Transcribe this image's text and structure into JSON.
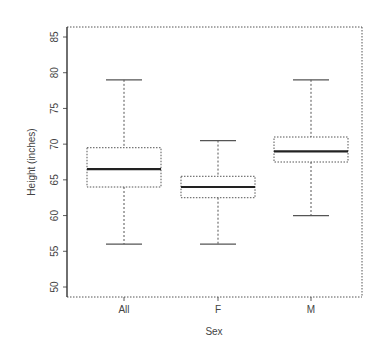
{
  "chart_data": {
    "type": "box",
    "title": "",
    "xlabel": "Sex",
    "ylabel": "Height (inches)",
    "categories": [
      "All",
      "F",
      "M"
    ],
    "ylim": [
      48.5,
      86.5
    ],
    "yticks": [
      50,
      55,
      60,
      65,
      70,
      75,
      80,
      85
    ],
    "grid": false,
    "legend": null,
    "boxes": [
      {
        "name": "All",
        "whisker_low": 56,
        "q1": 64,
        "median": 66.5,
        "q3": 69.5,
        "whisker_high": 79
      },
      {
        "name": "F",
        "whisker_low": 56,
        "q1": 62.5,
        "median": 64,
        "q3": 65.5,
        "whisker_high": 70.5
      },
      {
        "name": "M",
        "whisker_low": 60,
        "q1": 67.5,
        "median": 69,
        "q3": 71,
        "whisker_high": 79
      }
    ]
  },
  "labels": {
    "xlabel": "Sex",
    "ylabel": "Height (inches)",
    "yticks": [
      "50",
      "55",
      "60",
      "65",
      "70",
      "75",
      "80",
      "85"
    ],
    "xticks": [
      "All",
      "F",
      "M"
    ]
  },
  "colors": {
    "box_stroke": "#555555",
    "median": "#222222",
    "axis": "#333333",
    "background": "#ffffff"
  }
}
